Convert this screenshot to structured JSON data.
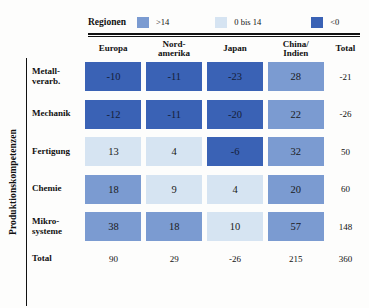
{
  "vertical_axis_label": "Produktionskompetenzen",
  "legend": {
    "title": "Regionen",
    "items": [
      {
        "label": ">14",
        "color": "#7b9bd1"
      },
      {
        "label": "0 bis 14",
        "color": "#d6e4f2"
      },
      {
        "label": "<0",
        "color": "#3a62b5"
      }
    ]
  },
  "columns": [
    "Europa",
    "Nord-\namerika",
    "Japan",
    "China/\nIndien"
  ],
  "total_header": "Total",
  "total_row_label": "Total",
  "chart_data": {
    "type": "heatmap",
    "xlabel": "Regionen",
    "ylabel": "Produktionskompetenzen",
    "categories_x": [
      "Europa",
      "Nord-amerika",
      "Japan",
      "China/Indien"
    ],
    "categories_y": [
      "Metall-verarb.",
      "Mechanik",
      "Fertigung",
      "Chemie",
      "Mikro-systeme"
    ],
    "legend_bands": [
      {
        "label": ">14",
        "color": "#7b9bd1",
        "min": 15,
        "max": 999
      },
      {
        "label": "0 bis 14",
        "color": "#d6e4f2",
        "min": 0,
        "max": 14
      },
      {
        "label": "<0",
        "color": "#3a62b5",
        "min": -999,
        "max": -1
      }
    ],
    "legend_position": "top",
    "grid": false,
    "rows": [
      {
        "label": "Metall-\nverarb.",
        "values": [
          -10,
          -11,
          -23,
          28
        ],
        "total": -21
      },
      {
        "label": "Mechanik",
        "values": [
          -12,
          -11,
          -20,
          22
        ],
        "total": -26
      },
      {
        "label": "Fertigung",
        "values": [
          13,
          4,
          -6,
          32
        ],
        "total": 50
      },
      {
        "label": "Chemie",
        "values": [
          18,
          9,
          4,
          20
        ],
        "total": 60
      },
      {
        "label": "Mikro-\nsysteme",
        "values": [
          38,
          18,
          10,
          57
        ],
        "total": 148
      }
    ],
    "column_totals": [
      90,
      29,
      -26,
      215
    ],
    "grand_total": 360
  }
}
